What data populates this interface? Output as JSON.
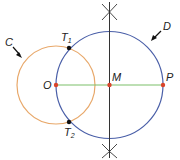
{
  "colors": {
    "circle_c": "#e8a86a",
    "circle_d": "#4a5fa8",
    "segment_op": "#7cc06a",
    "bisector": "#333333",
    "point_red": "#d9442b",
    "point_black": "#111111",
    "label": "#222222"
  },
  "circles": [
    {
      "name": "C",
      "cx": 56,
      "cy": 85,
      "r": 39
    },
    {
      "name": "D",
      "cx": 109.5,
      "cy": 85,
      "r": 53.5
    }
  ],
  "points": {
    "O": {
      "label": "O",
      "x": 56,
      "y": 85
    },
    "M": {
      "label": "M",
      "x": 109.5,
      "y": 85
    },
    "P": {
      "label": "P",
      "x": 163,
      "y": 85
    },
    "T1": {
      "label": "T",
      "sub": "1",
      "x": 69,
      "y": 48
    },
    "T2": {
      "label": "T",
      "sub": "2",
      "x": 69,
      "y": 122
    }
  },
  "labels": {
    "C": "C",
    "D": "D"
  }
}
